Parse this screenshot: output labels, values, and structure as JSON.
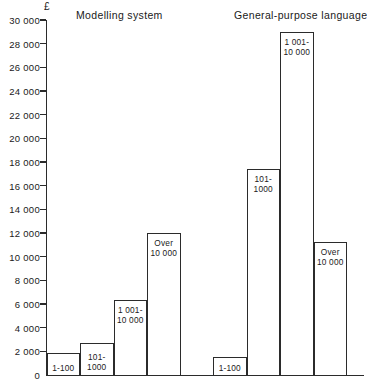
{
  "chart_data": {
    "type": "bar",
    "title": "",
    "xlabel": "",
    "ylabel": "£",
    "ylim": [
      0,
      30000
    ],
    "ytick_step": 2000,
    "yticks": [
      "0",
      "2 000",
      "4 000",
      "6 000",
      "8 000",
      "10 000",
      "12 000",
      "14 000",
      "16 000",
      "18 000",
      "20 000",
      "22 000",
      "24 000",
      "26 000",
      "28 000",
      "30 000"
    ],
    "grid": false,
    "legend": "none",
    "axis_color": "#2b2b2b",
    "bar_fill": "#ffffff",
    "bar_border": "#2b2b2b",
    "groups": [
      {
        "name": "Modelling system",
        "bars": [
          {
            "category_line1": "1-100",
            "category_line2": "",
            "value": 1850
          },
          {
            "category_line1": "101-",
            "category_line2": "1000",
            "value": 2700
          },
          {
            "category_line1": "1 001-",
            "category_line2": "10 000",
            "value": 6300
          },
          {
            "category_line1": "Over",
            "category_line2": "10 000",
            "value": 12000
          }
        ]
      },
      {
        "name": "General-purpose language",
        "bars": [
          {
            "category_line1": "1-100",
            "category_line2": "",
            "value": 1500
          },
          {
            "category_line1": "101-",
            "category_line2": "1000",
            "value": 17400
          },
          {
            "category_line1": "1 001-",
            "category_line2": "10 000",
            "value": 29000
          },
          {
            "category_line1": "Over",
            "category_line2": "10 000",
            "value": 11200
          }
        ]
      }
    ]
  }
}
